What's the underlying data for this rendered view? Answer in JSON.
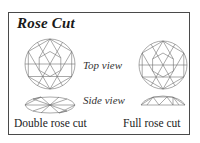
{
  "diagram": {
    "title": "Rose Cut",
    "view_labels": {
      "top": "Top view",
      "side": "Side view"
    },
    "cuts": [
      {
        "name": "Double rose cut",
        "views": [
          "top-view-facets",
          "side-view-double-dome"
        ]
      },
      {
        "name": "Full rose cut",
        "views": [
          "top-view-facets",
          "side-view-flat-dome"
        ]
      }
    ],
    "colors": {
      "border": "#4a4a4a",
      "line_art": "#707070",
      "text": "#222222",
      "background": "#ffffff"
    }
  }
}
